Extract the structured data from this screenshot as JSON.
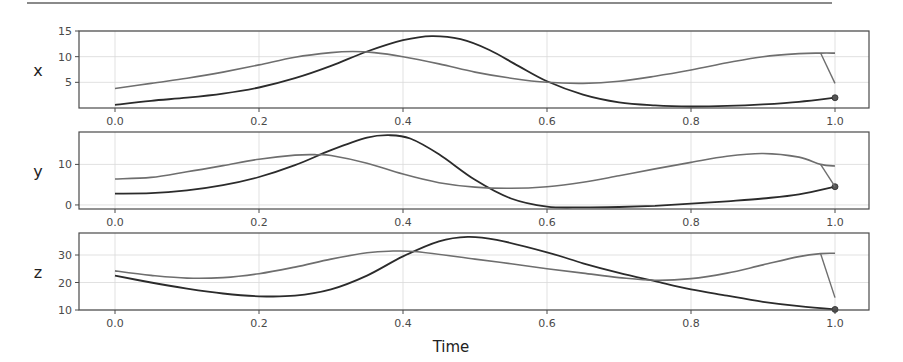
{
  "figure": {
    "xlabel": "Time",
    "x_tick_labels": [
      "0.0",
      "0.2",
      "0.4",
      "0.6",
      "0.8",
      "1.0"
    ]
  },
  "colors": {
    "series_dark": "#2b2b2b",
    "series_gray": "#6e6e6e",
    "grid": "#d9d9d9",
    "frame": "#4a4a4a"
  },
  "chart_data": [
    {
      "type": "line",
      "ylabel": "x",
      "xlabel": "",
      "xlim": [
        -0.05,
        1.05
      ],
      "ylim": [
        0,
        15
      ],
      "yticks": [
        5,
        10,
        15
      ],
      "grid": true,
      "series": [
        {
          "name": "trajectory_dark",
          "x": [
            0.0,
            0.05,
            0.1,
            0.15,
            0.2,
            0.25,
            0.3,
            0.35,
            0.4,
            0.44,
            0.48,
            0.52,
            0.56,
            0.6,
            0.65,
            0.7,
            0.75,
            0.8,
            0.85,
            0.9,
            0.95,
            1.0
          ],
          "values": [
            0.6,
            1.4,
            2.0,
            2.8,
            4.0,
            5.8,
            8.2,
            11.0,
            13.2,
            14.0,
            13.4,
            11.3,
            8.2,
            5.2,
            2.6,
            1.1,
            0.5,
            0.3,
            0.4,
            0.7,
            1.2,
            2.0
          ],
          "end_marker": true
        },
        {
          "name": "trajectory_gray",
          "x": [
            0.0,
            0.05,
            0.1,
            0.15,
            0.2,
            0.25,
            0.3,
            0.33,
            0.36,
            0.4,
            0.45,
            0.5,
            0.55,
            0.6,
            0.65,
            0.7,
            0.75,
            0.8,
            0.85,
            0.9,
            0.95,
            0.98,
            1.0
          ],
          "values": [
            3.8,
            4.8,
            5.8,
            7.0,
            8.4,
            9.9,
            10.8,
            11.0,
            10.8,
            10.0,
            8.6,
            7.0,
            5.8,
            5.0,
            4.8,
            5.2,
            6.2,
            7.4,
            8.8,
            10.0,
            10.6,
            10.7,
            10.7
          ],
          "end_hook": [
            10.7,
            4.8
          ]
        }
      ]
    },
    {
      "type": "line",
      "ylabel": "y",
      "xlabel": "",
      "xlim": [
        -0.05,
        1.05
      ],
      "ylim": [
        -1,
        18
      ],
      "yticks": [
        0,
        10
      ],
      "grid": true,
      "series": [
        {
          "name": "trajectory_dark",
          "x": [
            0.0,
            0.05,
            0.1,
            0.15,
            0.2,
            0.25,
            0.3,
            0.35,
            0.38,
            0.41,
            0.45,
            0.5,
            0.55,
            0.6,
            0.65,
            0.7,
            0.75,
            0.8,
            0.85,
            0.9,
            0.95,
            1.0
          ],
          "values": [
            2.8,
            2.9,
            3.6,
            4.9,
            6.9,
            9.8,
            13.5,
            16.6,
            17.2,
            16.4,
            12.5,
            6.2,
            1.6,
            -0.4,
            -0.6,
            -0.5,
            -0.2,
            0.3,
            0.9,
            1.6,
            2.6,
            4.5
          ],
          "end_marker": true
        },
        {
          "name": "trajectory_gray",
          "x": [
            0.0,
            0.05,
            0.1,
            0.15,
            0.2,
            0.25,
            0.28,
            0.3,
            0.35,
            0.4,
            0.45,
            0.5,
            0.55,
            0.6,
            0.65,
            0.7,
            0.75,
            0.8,
            0.85,
            0.9,
            0.95,
            0.98,
            1.0
          ],
          "values": [
            6.4,
            6.8,
            8.2,
            9.7,
            11.3,
            12.3,
            12.4,
            12.2,
            10.3,
            7.6,
            5.5,
            4.4,
            4.1,
            4.5,
            5.6,
            7.2,
            8.9,
            10.5,
            12.0,
            12.7,
            11.8,
            10.0,
            9.6
          ],
          "end_hook": [
            10.0,
            4.5
          ]
        }
      ]
    },
    {
      "type": "line",
      "ylabel": "z",
      "xlabel": "Time",
      "xlim": [
        -0.05,
        1.05
      ],
      "ylim": [
        10,
        38
      ],
      "yticks": [
        10,
        20,
        30
      ],
      "grid": true,
      "series": [
        {
          "name": "trajectory_dark",
          "x": [
            0.0,
            0.05,
            0.1,
            0.15,
            0.2,
            0.25,
            0.3,
            0.35,
            0.4,
            0.45,
            0.49,
            0.53,
            0.6,
            0.65,
            0.7,
            0.75,
            0.8,
            0.85,
            0.9,
            0.95,
            1.0
          ],
          "values": [
            22.5,
            20.0,
            17.8,
            16.0,
            15.0,
            15.2,
            17.5,
            22.5,
            29.5,
            35.0,
            36.6,
            35.5,
            31.0,
            27.0,
            23.5,
            20.5,
            17.5,
            15.2,
            13.0,
            11.4,
            10.2
          ],
          "end_marker": true
        },
        {
          "name": "trajectory_gray",
          "x": [
            0.0,
            0.05,
            0.1,
            0.15,
            0.2,
            0.25,
            0.3,
            0.35,
            0.38,
            0.42,
            0.5,
            0.55,
            0.6,
            0.65,
            0.7,
            0.75,
            0.8,
            0.85,
            0.9,
            0.95,
            0.98,
            1.0
          ],
          "values": [
            24.2,
            22.6,
            21.6,
            21.8,
            23.2,
            25.6,
            28.5,
            30.8,
            31.4,
            31.2,
            28.5,
            26.8,
            25.0,
            23.4,
            21.8,
            20.8,
            21.4,
            23.4,
            26.4,
            29.4,
            30.5,
            30.6
          ],
          "end_hook": [
            30.5,
            14.5
          ]
        }
      ]
    }
  ]
}
